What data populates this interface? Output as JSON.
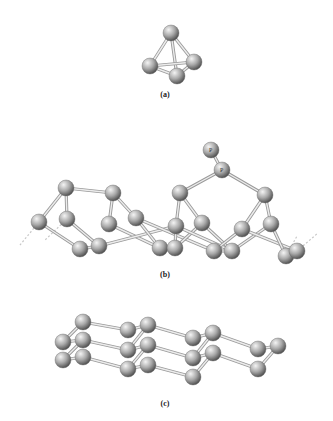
{
  "figure": {
    "panels": [
      {
        "id": "a",
        "label": "(a)",
        "label_pos": [
          165,
          96
        ],
        "description": "Tetrahedral P4 molecule",
        "atoms": [
          [
            171,
            33
          ],
          [
            150,
            66
          ],
          [
            194,
            62
          ],
          [
            177,
            76
          ]
        ],
        "bonds": [
          [
            0,
            1
          ],
          [
            0,
            2
          ],
          [
            0,
            3
          ],
          [
            1,
            2
          ],
          [
            1,
            3
          ],
          [
            2,
            3
          ]
        ]
      },
      {
        "id": "b",
        "label": "(b)",
        "label_pos": [
          165,
          276
        ],
        "description": "Puckered tubular phosphorus chain with capping P atoms",
        "atoms": [
          [
            66,
            188
          ],
          [
            113,
            193
          ],
          [
            39,
            222
          ],
          [
            67,
            219
          ],
          [
            109,
            224
          ],
          [
            80,
            249
          ],
          [
            99,
            246
          ],
          [
            136,
            218
          ],
          [
            160,
            248
          ],
          [
            175,
            248
          ],
          [
            180,
            193
          ],
          [
            176,
            226
          ],
          [
            202,
            223
          ],
          [
            214,
            251
          ],
          [
            232,
            251
          ],
          [
            265,
            195
          ],
          [
            242,
            229
          ],
          [
            271,
            224
          ],
          [
            286,
            256
          ],
          [
            297,
            251
          ],
          [
            222,
            170
          ],
          [
            211,
            150
          ]
        ],
        "bonds": [
          [
            0,
            1
          ],
          [
            0,
            2
          ],
          [
            0,
            3
          ],
          [
            1,
            4
          ],
          [
            1,
            7
          ],
          [
            2,
            5
          ],
          [
            3,
            6
          ],
          [
            4,
            8
          ],
          [
            5,
            6
          ],
          [
            6,
            11
          ],
          [
            7,
            8
          ],
          [
            7,
            13
          ],
          [
            8,
            9
          ],
          [
            9,
            11
          ],
          [
            9,
            12
          ],
          [
            10,
            11
          ],
          [
            10,
            12
          ],
          [
            10,
            20
          ],
          [
            12,
            14
          ],
          [
            11,
            14
          ],
          [
            13,
            14
          ],
          [
            13,
            16
          ],
          [
            14,
            17
          ],
          [
            15,
            16
          ],
          [
            15,
            17
          ],
          [
            15,
            20
          ],
          [
            16,
            19
          ],
          [
            17,
            18
          ],
          [
            18,
            19
          ],
          [
            20,
            21
          ]
        ],
        "p_labels": [
          {
            "text": "P",
            "pos": [
              211,
              150
            ]
          },
          {
            "text": "P",
            "pos": [
              222,
              170
            ]
          }
        ],
        "dashed": [
          [
            [
              39,
              222
            ],
            [
              20,
              245
            ]
          ],
          [
            [
              67,
              219
            ],
            [
              45,
              240
            ]
          ],
          [
            [
              286,
              256
            ],
            [
              297,
              236
            ]
          ],
          [
            [
              297,
              251
            ],
            [
              318,
              233
            ]
          ]
        ]
      },
      {
        "id": "c",
        "label": "(c)",
        "label_pos": [
          165,
          405
        ],
        "description": "Layered black phosphorus sheets",
        "atoms": [
          [
            83,
            322
          ],
          [
            63,
            342
          ],
          [
            83,
            340
          ],
          [
            63,
            360
          ],
          [
            83,
            357
          ],
          [
            128,
            330
          ],
          [
            148,
            325
          ],
          [
            128,
            350
          ],
          [
            148,
            345
          ],
          [
            128,
            369
          ],
          [
            148,
            365
          ],
          [
            193,
            338
          ],
          [
            213,
            333
          ],
          [
            193,
            358
          ],
          [
            213,
            353
          ],
          [
            193,
            377
          ],
          [
            258,
            349
          ],
          [
            278,
            346
          ],
          [
            258,
            369
          ]
        ],
        "bonds": [
          [
            0,
            1
          ],
          [
            1,
            2
          ],
          [
            2,
            3
          ],
          [
            3,
            4
          ],
          [
            0,
            5
          ],
          [
            2,
            7
          ],
          [
            4,
            9
          ],
          [
            5,
            6
          ],
          [
            6,
            7
          ],
          [
            7,
            8
          ],
          [
            8,
            9
          ],
          [
            9,
            10
          ],
          [
            6,
            11
          ],
          [
            8,
            13
          ],
          [
            10,
            15
          ],
          [
            11,
            12
          ],
          [
            12,
            13
          ],
          [
            13,
            14
          ],
          [
            14,
            15
          ],
          [
            12,
            16
          ],
          [
            14,
            18
          ],
          [
            16,
            17
          ],
          [
            17,
            18
          ]
        ]
      }
    ],
    "colors": {
      "atom_light": "#f2f2f2",
      "atom_mid": "#a8a8a8",
      "atom_dark": "#5a5a5a",
      "bond": "#bdbdbd",
      "dashed": "#c8c8c8",
      "label": "#222222"
    }
  }
}
